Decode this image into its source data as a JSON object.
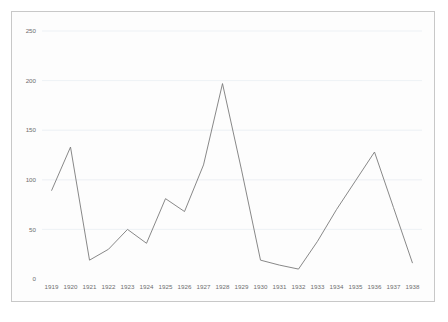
{
  "chart_data": {
    "type": "line",
    "title": "",
    "subtitle": "",
    "xlabel": "",
    "ylabel": "",
    "categories": [
      "1919",
      "1920",
      "1921",
      "1922",
      "1923",
      "1924",
      "1925",
      "1926",
      "1927",
      "1928",
      "1929",
      "1930",
      "1931",
      "1932",
      "1933",
      "1934",
      "1935",
      "1936",
      "1937",
      "1938"
    ],
    "values": [
      89,
      133,
      19,
      30,
      50,
      36,
      81,
      68,
      115,
      197,
      110,
      19,
      14,
      10,
      38,
      70,
      99,
      128,
      72,
      16
    ],
    "series": [
      {
        "name": "series-1",
        "values": [
          89,
          133,
          19,
          30,
          50,
          36,
          81,
          68,
          115,
          197,
          110,
          19,
          14,
          10,
          38,
          70,
          99,
          128,
          72,
          16
        ]
      }
    ],
    "ylim": [
      0,
      250
    ],
    "yticks": [
      0,
      50,
      100,
      150,
      200,
      250
    ],
    "ytick_labels": [
      "0",
      "50",
      "100",
      "150",
      "200",
      "250"
    ],
    "xtick_labels": [
      "1919",
      "1920",
      "1921",
      "1922",
      "1923",
      "1924",
      "1925",
      "1926",
      "1927",
      "1928",
      "1929",
      "1930",
      "1931",
      "1932",
      "1933",
      "1934",
      "1935",
      "1936",
      "1937",
      "1938"
    ],
    "grid": true,
    "grid_axis": "y",
    "legend": false,
    "legend_position": "none",
    "annotations": [],
    "colors": {
      "line": "#7a7a7a",
      "grid": "#e9eef2",
      "frame": "#c8c8c8",
      "tick_text": "#6d6d6d",
      "plot_background": "#fdfdfd",
      "figure_background": "#ffffff"
    }
  }
}
